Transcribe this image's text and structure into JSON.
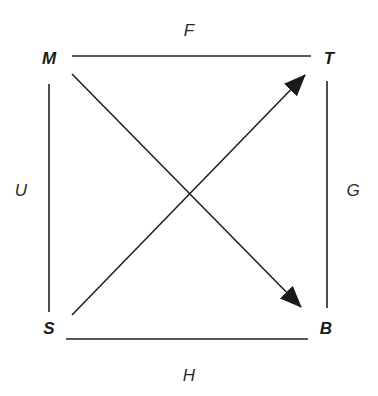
{
  "diagram": {
    "type": "directed-graph-square",
    "colors": {
      "line": "#222222",
      "text": "#1a1a1a",
      "background": "#ffffff"
    },
    "nodes": {
      "M": {
        "label": "M",
        "x": 49,
        "y": 64
      },
      "T": {
        "label": "T",
        "x": 329,
        "y": 64
      },
      "S": {
        "label": "S",
        "x": 49,
        "y": 334
      },
      "B": {
        "label": "B",
        "x": 326,
        "y": 334
      }
    },
    "edges": {
      "top": {
        "label": "F",
        "from": "M",
        "to": "T",
        "directed": false,
        "label_x": 189,
        "label_y": 36
      },
      "left": {
        "label": "U",
        "from": "M",
        "to": "S",
        "directed": false,
        "label_x": 21,
        "label_y": 196
      },
      "right": {
        "label": "G",
        "from": "T",
        "to": "B",
        "directed": false,
        "label_x": 353,
        "label_y": 196
      },
      "bottom": {
        "label": "H",
        "from": "S",
        "to": "B",
        "directed": false,
        "label_x": 189,
        "label_y": 381
      },
      "diag1": {
        "label": "",
        "from": "M",
        "to": "B",
        "directed": true
      },
      "diag2": {
        "label": "",
        "from": "S",
        "to": "T",
        "directed": true
      }
    }
  }
}
